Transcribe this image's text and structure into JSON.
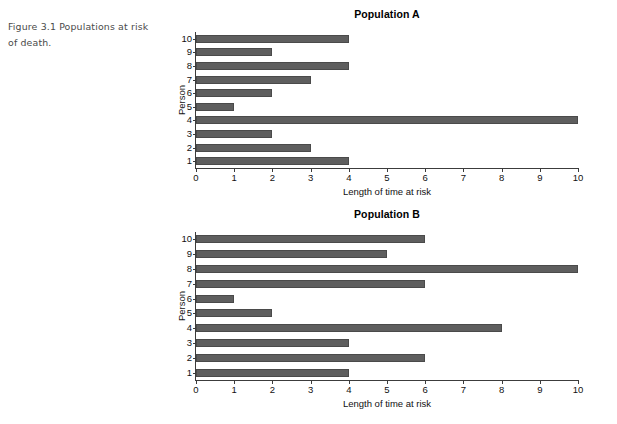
{
  "figure": {
    "caption": "Figure 3.1  Populations at risk of death."
  },
  "colors": {
    "bar_fill": "#5e5e5e",
    "axis": "#3c3c3c",
    "text": "#111111",
    "caption_text": "#4a4a4a",
    "background": "#ffffff"
  },
  "chart_data": [
    {
      "type": "bar",
      "orientation": "horizontal",
      "title": "Population A",
      "xlabel": "Length of time at risk",
      "ylabel": "Person",
      "categories": [
        "1",
        "2",
        "3",
        "4",
        "5",
        "6",
        "7",
        "8",
        "9",
        "10"
      ],
      "values": [
        4,
        3,
        2,
        10,
        1,
        2,
        3,
        4,
        2,
        4
      ],
      "xlim": [
        0,
        10
      ],
      "xticks": [
        0,
        1,
        2,
        3,
        4,
        5,
        6,
        7,
        8,
        9,
        10
      ],
      "xtick_labels": [
        "0",
        "1",
        "2",
        "3",
        "4",
        "5",
        "6",
        "7",
        "8",
        "9",
        "10"
      ],
      "ytick_labels": [
        "10",
        "9",
        "8",
        "7",
        "6",
        "5",
        "4",
        "3",
        "2",
        "1"
      ],
      "grid": false,
      "legend": false
    },
    {
      "type": "bar",
      "orientation": "horizontal",
      "title": "Population B",
      "xlabel": "Length of time at risk",
      "ylabel": "Person",
      "categories": [
        "1",
        "2",
        "3",
        "4",
        "5",
        "6",
        "7",
        "8",
        "9",
        "10"
      ],
      "values": [
        4,
        6,
        4,
        8,
        2,
        1,
        6,
        10,
        5,
        6
      ],
      "xlim": [
        0,
        10
      ],
      "xticks": [
        0,
        1,
        2,
        3,
        4,
        5,
        6,
        7,
        8,
        9,
        10
      ],
      "xtick_labels": [
        "0",
        "1",
        "2",
        "3",
        "4",
        "5",
        "6",
        "7",
        "8",
        "9",
        "10"
      ],
      "ytick_labels": [
        "10",
        "9",
        "8",
        "7",
        "6",
        "5",
        "4",
        "3",
        "2",
        "1"
      ],
      "grid": false,
      "legend": false
    }
  ]
}
